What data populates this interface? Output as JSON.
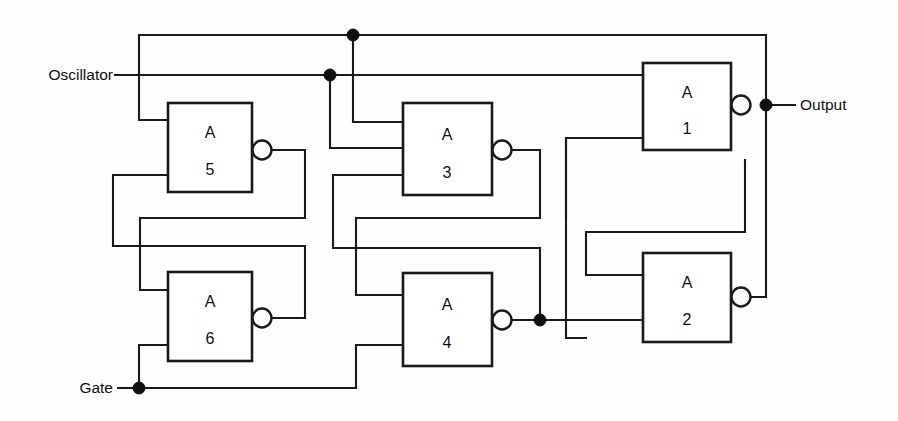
{
  "diagram": {
    "background_color": "#fefefe",
    "line_color": "#1a1a1a",
    "gates": [
      {
        "id": "A1",
        "designator": "A",
        "number": "1",
        "x": 643,
        "y": 63,
        "w": 88,
        "h": 87,
        "inputs": 2,
        "inverted_output": true
      },
      {
        "id": "A2",
        "designator": "A",
        "number": "2",
        "x": 643,
        "y": 253,
        "w": 88,
        "h": 89,
        "inputs": 2,
        "inverted_output": true
      },
      {
        "id": "A3",
        "designator": "A",
        "number": "3",
        "x": 403,
        "y": 103,
        "w": 89,
        "h": 92,
        "inputs": 3,
        "inverted_output": true
      },
      {
        "id": "A4",
        "designator": "A",
        "number": "4",
        "x": 403,
        "y": 273,
        "w": 89,
        "h": 93,
        "inputs": 2,
        "inverted_output": true
      },
      {
        "id": "A5",
        "designator": "A",
        "number": "5",
        "x": 168,
        "y": 103,
        "w": 84,
        "h": 89,
        "inputs": 2,
        "inverted_output": true
      },
      {
        "id": "A6",
        "designator": "A",
        "number": "6",
        "x": 168,
        "y": 272,
        "w": 84,
        "h": 89,
        "inputs": 2,
        "inverted_output": true
      }
    ],
    "ports": [
      {
        "name": "oscillator-input",
        "label": "Oscillator",
        "side": "left",
        "x": 113,
        "y": 75,
        "anchor": "end"
      },
      {
        "name": "gate-input",
        "label": "Gate",
        "side": "left",
        "x": 113,
        "y": 388,
        "anchor": "end"
      },
      {
        "name": "output-port",
        "label": "Output",
        "side": "right",
        "x": 800,
        "y": 105,
        "anchor": "start"
      }
    ],
    "junctions": [
      {
        "name": "osc-top-tap",
        "x": 353,
        "y": 35
      },
      {
        "name": "osc-mid-tap",
        "x": 330,
        "y": 75
      },
      {
        "name": "output-node",
        "x": 766,
        "y": 105
      },
      {
        "name": "a4-output-node",
        "x": 540,
        "y": 320
      },
      {
        "name": "gate-node",
        "x": 139,
        "y": 388
      }
    ]
  }
}
